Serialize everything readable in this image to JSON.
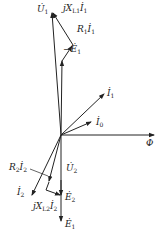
{
  "diagram": {
    "type": "transformer phasor diagram",
    "origin": [
      61,
      135
    ],
    "colors": {
      "line": "#222222",
      "background": "#ffffff"
    },
    "phasors": [
      {
        "id": "U1",
        "label": "U̇",
        "sub": "1",
        "from": [
          61,
          135
        ],
        "to": [
          52,
          12
        ]
      },
      {
        "id": "minusE1",
        "label": "−Ė",
        "sub": "1",
        "from": [
          61,
          135
        ],
        "to": [
          62,
          60
        ]
      },
      {
        "id": "R1I1",
        "label": "R",
        "sub": "1",
        "suffix": "İ₁",
        "from": [
          62,
          60
        ],
        "to": [
          73,
          45
        ]
      },
      {
        "id": "jXL1I1",
        "label": "jX",
        "sub": "L1",
        "suffix": "İ₁",
        "from": [
          73,
          45
        ],
        "to": [
          52,
          12
        ]
      },
      {
        "id": "I1",
        "label": "İ",
        "sub": "1",
        "from": [
          61,
          135
        ],
        "to": [
          105,
          93
        ]
      },
      {
        "id": "I0",
        "label": "İ",
        "sub": "0",
        "from": [
          61,
          135
        ],
        "to": [
          92,
          122
        ]
      },
      {
        "id": "Phi",
        "label": "Φ",
        "sub": "",
        "from": [
          61,
          135
        ],
        "to": [
          155,
          135
        ]
      },
      {
        "id": "U2",
        "label": "U̇",
        "sub": "2",
        "from": [
          61,
          135
        ],
        "to": [
          49,
          182
        ]
      },
      {
        "id": "R2I2",
        "label": "R",
        "sub": "2",
        "suffix": "İ₂",
        "from": [
          49,
          182
        ],
        "to": [
          46,
          190
        ]
      },
      {
        "id": "jXL2I2",
        "label": "jX",
        "sub": "L2",
        "suffix": "İ₂",
        "from": [
          46,
          190
        ],
        "to": [
          61,
          196
        ]
      },
      {
        "id": "E2",
        "label": "Ė",
        "sub": "2",
        "from": [
          61,
          135
        ],
        "to": [
          61,
          196
        ]
      },
      {
        "id": "E1",
        "label": "Ė",
        "sub": "1",
        "from": [
          61,
          135
        ],
        "to": [
          61,
          222
        ]
      },
      {
        "id": "I2",
        "label": "İ",
        "sub": "2",
        "from": [
          61,
          135
        ],
        "to": [
          31,
          196
        ]
      }
    ]
  },
  "labels": {
    "U1": {
      "main": "U̇",
      "sub": "1"
    },
    "jXL1I1": {
      "main": "jX",
      "sub": "L1",
      "tail": "İ",
      "tailsub": "1"
    },
    "R1I1": {
      "main": "R",
      "sub": "1",
      "tail": "İ",
      "tailsub": "1"
    },
    "minusE1": {
      "main": "−Ė",
      "sub": "1"
    },
    "I1": {
      "main": "İ",
      "sub": "1"
    },
    "I0": {
      "main": "İ",
      "sub": "0"
    },
    "Phi": {
      "main": "Φ"
    },
    "R2I2": {
      "main": "R",
      "sub": "2",
      "tail": "İ",
      "tailsub": "2"
    },
    "U2": {
      "main": "U̇",
      "sub": "2"
    },
    "I2": {
      "main": "İ",
      "sub": "2"
    },
    "jXL2I2": {
      "main": "jX",
      "sub": "L2",
      "tail": "İ",
      "tailsub": "2"
    },
    "E2": {
      "main": "Ė",
      "sub": "2"
    },
    "E1": {
      "main": "Ė",
      "sub": "1"
    }
  }
}
